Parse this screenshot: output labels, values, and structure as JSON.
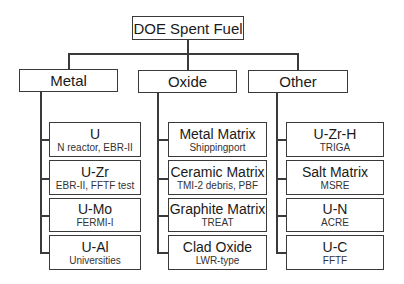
{
  "root": {
    "label": "DOE Spent Fuel"
  },
  "categories": [
    {
      "label": "Metal",
      "items": [
        {
          "title": "U",
          "sub": "N reactor, EBR-II"
        },
        {
          "title": "U-Zr",
          "sub": "EBR-II, FFTF test"
        },
        {
          "title": "U-Mo",
          "sub": "FERMI-I"
        },
        {
          "title": "U-Al",
          "sub": "Universities"
        }
      ]
    },
    {
      "label": "Oxide",
      "items": [
        {
          "title": "Metal Matrix",
          "sub": "Shippingport"
        },
        {
          "title": "Ceramic Matrix",
          "sub": "TMI-2 debris, PBF"
        },
        {
          "title": "Graphite Matrix",
          "sub": "TREAT"
        },
        {
          "title": "Clad Oxide",
          "sub": "LWR-type"
        }
      ]
    },
    {
      "label": "Other",
      "items": [
        {
          "title": "U-Zr-H",
          "sub": "TRIGA"
        },
        {
          "title": "Salt Matrix",
          "sub": "MSRE"
        },
        {
          "title": "U-N",
          "sub": "ACRE"
        },
        {
          "title": "U-C",
          "sub": "FFTF"
        }
      ]
    }
  ]
}
